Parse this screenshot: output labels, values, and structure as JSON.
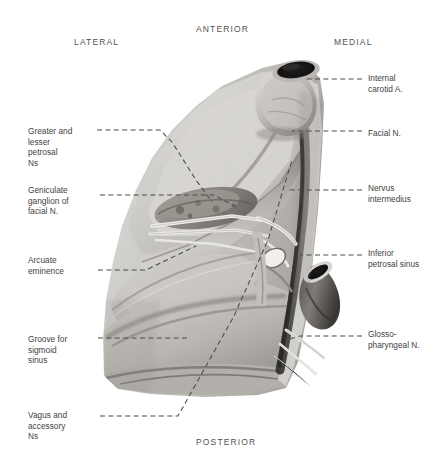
{
  "figure": {
    "style": "grayscale anatomical illustration",
    "background_color": "#ffffff",
    "ink_color": "#3f3f3e",
    "leader_line_color": "#4a4a4a"
  },
  "orientation": {
    "anterior": "ANTERIOR",
    "posterior": "POSTERIOR",
    "lateral": "LATERAL",
    "medial": "MEDIAL"
  },
  "labels": {
    "internal_carotid": "Internal\ncarotid A.",
    "facial_n": "Facial N.",
    "nervus_intermedius": "Nervus\nintermedius",
    "inferior_petrosal_sinus": "Inferior\npetrosal sinus",
    "glossopharyngeal_n": "Glosso-\npharyngeal N.",
    "greater_lesser_petrosal": "Greater and\nlesser\npetrosal\nNs",
    "geniculate_ganglion": "Geniculate\nganglion of\nfacial N.",
    "arcuate_eminence": "Arcuate\neminence",
    "groove_sigmoid_sinus": "Groove for\nsigmoid\nsinus",
    "vagus_accessory": "Vagus and\naccessory\nNs"
  }
}
